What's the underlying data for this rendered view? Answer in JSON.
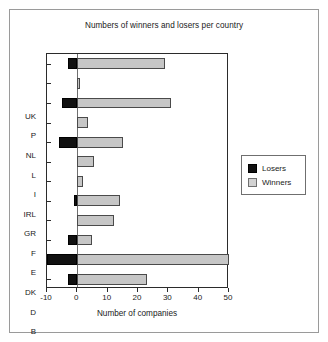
{
  "chart_data": {
    "type": "bar",
    "orientation": "horizontal",
    "title": "Numbers of winners and losers per country",
    "xlabel": "Number of companies",
    "ylabel": "",
    "xlim": [
      -10,
      50
    ],
    "xticks": [
      -10,
      0,
      10,
      20,
      30,
      40,
      50
    ],
    "xticklabels": [
      "-10",
      "0",
      "10",
      "20",
      "30",
      "40",
      "50"
    ],
    "grid": false,
    "legend_position": "right",
    "categories": [
      "B",
      "D",
      "DK",
      "E",
      "F",
      "GR",
      "IRL",
      "I",
      "L",
      "NL",
      "P",
      "UK"
    ],
    "categories_top_to_bottom": [
      "UK",
      "P",
      "NL",
      "L",
      "I",
      "IRL",
      "GR",
      "F",
      "E",
      "DK",
      "D",
      "B"
    ],
    "series": [
      {
        "name": "Losers",
        "color": "#111111",
        "values": [
          -3,
          -10,
          -3,
          0,
          -1,
          0,
          0,
          -6,
          0,
          -5,
          0,
          -3
        ]
      },
      {
        "name": "Winners",
        "color": "#c6c6c6",
        "values": [
          23,
          50,
          5,
          12,
          14,
          2,
          5.5,
          15,
          3.5,
          31,
          1,
          29
        ]
      }
    ]
  },
  "legend": {
    "items": [
      {
        "label": "Losers",
        "swatch": "losers"
      },
      {
        "label": "Winners",
        "swatch": "winners"
      }
    ]
  }
}
